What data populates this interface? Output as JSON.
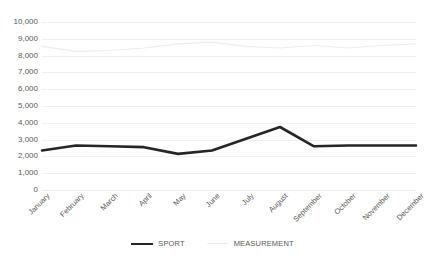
{
  "chart_data": {
    "type": "line",
    "title": "",
    "xlabel": "",
    "ylabel": "",
    "ylim": [
      0,
      10000
    ],
    "ystep": 1000,
    "grid": true,
    "legend_position": "bottom",
    "categories": [
      "January",
      "February",
      "March",
      "April",
      "May",
      "June",
      "July",
      "August",
      "September",
      "October",
      "November",
      "December"
    ],
    "ytick_labels": [
      "10,000",
      "9,000",
      "8,000",
      "7,000",
      "6,000",
      "5,000",
      "4,000",
      "3,000",
      "2,000",
      "1,000",
      "0"
    ],
    "series": [
      {
        "name": "SPORT",
        "color": "#262626",
        "width": 2.6,
        "values": [
          2350,
          2650,
          2600,
          2550,
          2150,
          2350,
          3050,
          3750,
          2600,
          2650,
          2650,
          2650
        ]
      },
      {
        "name": "MEASUREMENT",
        "color": "#ededed",
        "width": 1.1,
        "values": [
          8550,
          8250,
          8300,
          8450,
          8700,
          8800,
          8550,
          8450,
          8600,
          8450,
          8600,
          8700
        ]
      }
    ]
  },
  "legend": {
    "items": [
      {
        "label": "SPORT"
      },
      {
        "label": "MEASUREMENT"
      }
    ]
  }
}
